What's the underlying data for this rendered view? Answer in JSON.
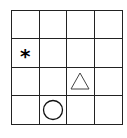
{
  "grid": {
    "rows": 4,
    "cols": 4,
    "line_color": "#222222"
  },
  "shapes": [
    {
      "type": "star",
      "symbol": "*",
      "row": 1,
      "col": 0,
      "color": "#000000"
    },
    {
      "type": "triangle",
      "row": 2,
      "col": 2,
      "stroke": "#444444",
      "fill": "none"
    },
    {
      "type": "circle",
      "row": 3,
      "col": 1,
      "stroke": "#111111",
      "fill": "none"
    }
  ],
  "labels": {
    "star": "*"
  }
}
